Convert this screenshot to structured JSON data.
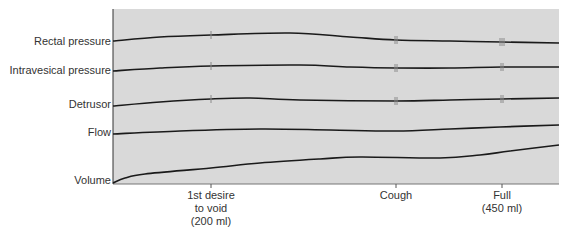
{
  "chart_data": {
    "type": "line",
    "title": "",
    "xlabel": "",
    "ylabel": "",
    "plot_area": {
      "left": 113,
      "top": 9,
      "right": 559,
      "bottom": 184
    },
    "background_color": "#d9d9d9",
    "trace_color": "#1a1a1a",
    "series": [
      {
        "name": "Rectal pressure",
        "label_y": 42,
        "points": [
          [
            113,
            41
          ],
          [
            160,
            37
          ],
          [
            211,
            35
          ],
          [
            290,
            33
          ],
          [
            350,
            37
          ],
          [
            396,
            40
          ],
          [
            450,
            41
          ],
          [
            502,
            42
          ],
          [
            559,
            43
          ]
        ],
        "markers": [
          {
            "x": 211,
            "count": 1
          },
          {
            "x": 396,
            "count": 2
          },
          {
            "x": 502,
            "count": 3
          }
        ]
      },
      {
        "name": "Intravesical pressure",
        "label_y": 71,
        "points": [
          [
            113,
            71
          ],
          [
            160,
            68
          ],
          [
            211,
            66
          ],
          [
            300,
            65
          ],
          [
            350,
            67
          ],
          [
            396,
            68
          ],
          [
            450,
            68
          ],
          [
            502,
            67
          ],
          [
            559,
            67
          ]
        ],
        "markers": [
          {
            "x": 211,
            "count": 1
          },
          {
            "x": 396,
            "count": 2
          },
          {
            "x": 502,
            "count": 2
          }
        ]
      },
      {
        "name": "Detrusor",
        "label_y": 105,
        "points": [
          [
            113,
            106
          ],
          [
            160,
            102
          ],
          [
            211,
            99
          ],
          [
            250,
            98
          ],
          [
            300,
            100
          ],
          [
            396,
            101
          ],
          [
            450,
            100
          ],
          [
            502,
            99
          ],
          [
            559,
            98
          ]
        ],
        "markers": [
          {
            "x": 211,
            "count": 1
          },
          {
            "x": 396,
            "count": 2
          },
          {
            "x": 502,
            "count": 2
          }
        ]
      },
      {
        "name": "Flow",
        "label_y": 133,
        "points": [
          [
            113,
            134
          ],
          [
            180,
            131
          ],
          [
            260,
            129
          ],
          [
            330,
            130
          ],
          [
            396,
            131
          ],
          [
            450,
            129
          ],
          [
            500,
            127
          ],
          [
            559,
            125
          ]
        ],
        "markers": []
      },
      {
        "name": "Volume",
        "label_y": 181,
        "points": [
          [
            113,
            183
          ],
          [
            125,
            178
          ],
          [
            145,
            174
          ],
          [
            211,
            168
          ],
          [
            260,
            163
          ],
          [
            320,
            159
          ],
          [
            360,
            157
          ],
          [
            440,
            158
          ],
          [
            480,
            155
          ],
          [
            510,
            151
          ],
          [
            559,
            145
          ]
        ],
        "markers": []
      }
    ],
    "events": [
      {
        "label_lines": [
          "1st desire",
          "to void",
          "(200 ml)"
        ],
        "x": 211
      },
      {
        "label_lines": [
          "Cough"
        ],
        "x": 396
      },
      {
        "label_lines": [
          "Full",
          "(450 ml)"
        ],
        "x": 502
      }
    ]
  }
}
